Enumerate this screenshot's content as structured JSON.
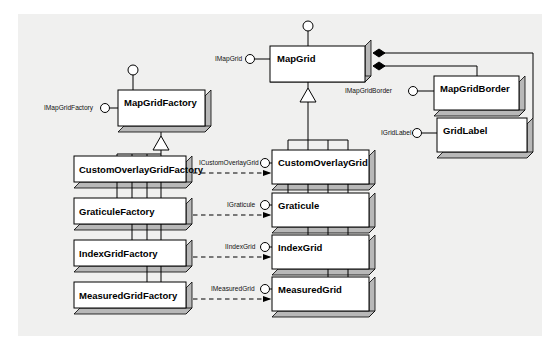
{
  "diagram": {
    "type": "uml-class-diagram",
    "background_color": "#f0f0ef",
    "box_fill": "#ffffff",
    "box_shadow_fill": "#b8b8b8",
    "line_color": "#000000"
  },
  "classes": {
    "map_grid": {
      "name": "MapGrid"
    },
    "map_grid_factory": {
      "name": "MapGridFactory"
    },
    "map_grid_border": {
      "name": "MapGridBorder"
    },
    "grid_label": {
      "name": "GridLabel"
    },
    "custom_overlay_grid": {
      "name": "CustomOverlayGrid"
    },
    "graticule": {
      "name": "Graticule"
    },
    "index_grid": {
      "name": "IndexGrid"
    },
    "measured_grid": {
      "name": "MeasuredGrid"
    },
    "custom_overlay_grid_factory": {
      "name": "CustomOverlayGridFactory"
    },
    "graticule_factory": {
      "name": "GraticuleFactory"
    },
    "index_grid_factory": {
      "name": "IndexGridFactory"
    },
    "measured_grid_factory": {
      "name": "MeasuredGridFactory"
    }
  },
  "interfaces": {
    "i_map_grid": {
      "name": "IMapGrid"
    },
    "i_map_grid_factory": {
      "name": "IMapGridFactory"
    },
    "i_map_grid_border": {
      "name": "IMapGridBorder"
    },
    "i_grid_label": {
      "name": "IGridLabel"
    },
    "i_custom_overlay_grid": {
      "name": "ICustomOverlayGrid"
    },
    "i_graticule": {
      "name": "IGraticule"
    },
    "i_index_grid": {
      "name": "IIndexGrid"
    },
    "i_measured_grid": {
      "name": "IMeasuredGrid"
    }
  },
  "relationships": {
    "composition": [
      {
        "from": "MapGrid",
        "to": "MapGridBorder",
        "marker": "filled-diamond"
      },
      {
        "from": "MapGrid",
        "to": "GridLabel",
        "marker": "filled-diamond"
      }
    ],
    "generalization": [
      {
        "from": "CustomOverlayGrid",
        "to": "MapGrid"
      },
      {
        "from": "Graticule",
        "to": "MapGrid"
      },
      {
        "from": "IndexGrid",
        "to": "MapGrid"
      },
      {
        "from": "MeasuredGrid",
        "to": "MapGrid"
      },
      {
        "from": "CustomOverlayGridFactory",
        "to": "MapGridFactory"
      },
      {
        "from": "GraticuleFactory",
        "to": "MapGridFactory"
      },
      {
        "from": "IndexGridFactory",
        "to": "MapGridFactory"
      },
      {
        "from": "MeasuredGridFactory",
        "to": "MapGridFactory"
      }
    ],
    "dependency": [
      {
        "from": "CustomOverlayGridFactory",
        "to": "CustomOverlayGrid",
        "label": "ICustomOverlayGrid"
      },
      {
        "from": "GraticuleFactory",
        "to": "Graticule",
        "label": "IGraticule"
      },
      {
        "from": "IndexGridFactory",
        "to": "IndexGrid",
        "label": "IIndexGrid"
      },
      {
        "from": "MeasuredGridFactory",
        "to": "MeasuredGrid",
        "label": "IMeasuredGrid"
      }
    ]
  }
}
